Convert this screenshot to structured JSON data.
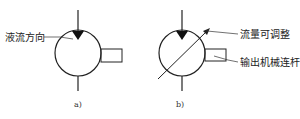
{
  "diagram": {
    "type": "hydraulic-symbol",
    "panels": [
      {
        "id": "a",
        "caption": "a)",
        "annotations": [
          {
            "text": "液流方向",
            "meaning": "flow direction"
          }
        ],
        "elements": [
          "circle",
          "inlet-line",
          "flow-triangle",
          "outlet-line",
          "shaft-rectangle"
        ]
      },
      {
        "id": "b",
        "caption": "b)",
        "annotations": [
          {
            "text": "流量可调整",
            "meaning": "adjustable flow"
          },
          {
            "text": "输出机械连杆",
            "meaning": "output mechanical linkage"
          }
        ],
        "elements": [
          "circle",
          "inlet-line",
          "flow-triangle",
          "outlet-line",
          "shaft-rectangle",
          "variable-arrow"
        ]
      }
    ]
  },
  "colors": {
    "stroke": "#222222",
    "text": "#222222",
    "background": "#ffffff"
  }
}
